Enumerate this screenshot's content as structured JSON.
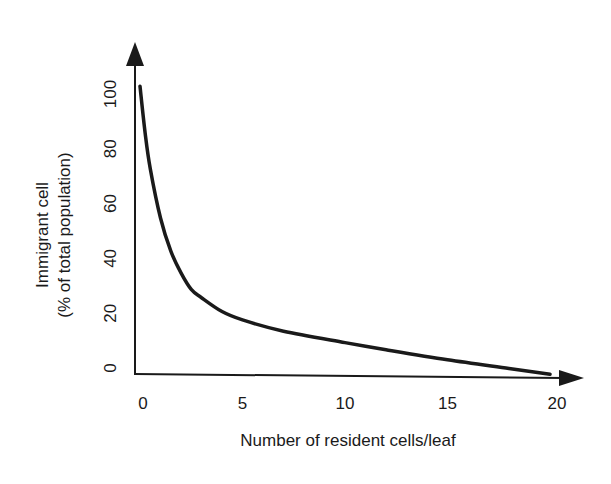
{
  "chart_data": {
    "type": "line",
    "title": "",
    "xlabel": "Number of resident cells/leaf",
    "ylabel": [
      "Immigrant cell",
      "(% of total population)"
    ],
    "xlim": [
      0,
      20
    ],
    "ylim": [
      0,
      100
    ],
    "x_ticks": [
      "0",
      "5",
      "10",
      "15",
      "20"
    ],
    "y_ticks": [
      "0",
      "20",
      "40",
      "60",
      "80",
      "100"
    ],
    "grid": false,
    "legend": null,
    "series": [
      {
        "name": "Immigrant cell percentage",
        "x": [
          0,
          0.25,
          0.5,
          1,
          1.5,
          2,
          2.5,
          3,
          4,
          5,
          7,
          10,
          12,
          15,
          18,
          20
        ],
        "values": [
          105,
          88,
          75,
          57,
          45,
          37,
          31,
          28,
          23,
          20,
          16,
          12,
          9.5,
          6,
          3,
          1
        ]
      }
    ]
  }
}
